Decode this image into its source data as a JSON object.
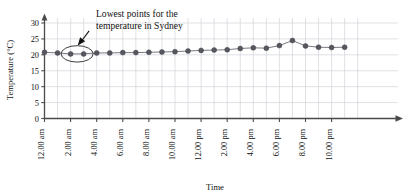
{
  "chart_data": {
    "type": "line",
    "title": "",
    "xlabel": "Time",
    "ylabel": "Temperature (°C)",
    "ylim": [
      0,
      30
    ],
    "ytick_values": [
      0,
      5,
      10,
      15,
      20,
      25,
      30
    ],
    "ytick_labels": [
      "0",
      "5",
      "10",
      "15",
      "20",
      "25",
      "30"
    ],
    "grid": true,
    "legend": "none",
    "x_tick_labels": [
      "12.00 am",
      "2.00 am",
      "4.00 am",
      "6.00 am",
      "8.00 am",
      "10.00 am",
      "12.00 pm",
      "2.00 pm",
      "4.00 pm",
      "6.00 pm",
      "8.00 pm",
      "10.00 pm"
    ],
    "x": [
      "12.00 am",
      "1.00 am",
      "2.00 am",
      "3.00 am",
      "4.00 am",
      "5.00 am",
      "6.00 am",
      "7.00 am",
      "8.00 am",
      "9.00 am",
      "10.00 am",
      "11.00 am",
      "12.00 pm",
      "1.00 pm",
      "2.00 pm",
      "3.00 pm",
      "4.00 pm",
      "5.00 pm",
      "6.00 pm",
      "7.00 pm",
      "8.00 pm",
      "9.00 pm",
      "10.00 pm",
      "11.00 pm"
    ],
    "values": [
      20.8,
      20.6,
      20.3,
      20.3,
      20.6,
      20.6,
      20.7,
      20.7,
      20.8,
      20.9,
      21.0,
      21.2,
      21.4,
      21.5,
      21.6,
      22.0,
      22.2,
      22.1,
      22.9,
      24.5,
      22.8,
      22.4,
      22.3,
      22.4
    ],
    "annotations": [
      {
        "text_line_1": "Lowest points for the",
        "text_line_2": "temperature in Sydney",
        "points_marked": [
          "2.00 am",
          "3.00 am"
        ],
        "marker_shape": "ellipse",
        "pointer": "arrow"
      }
    ],
    "colors": {
      "line": "#6b6b73",
      "marker": "#575760",
      "grid": "#c9cdd4",
      "axis": "#4a4a4a",
      "text": "#111111"
    }
  }
}
